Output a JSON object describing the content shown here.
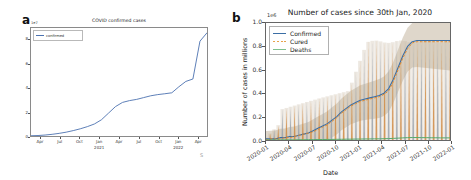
{
  "figure": {
    "panel_a_letter": "a",
    "panel_b_letter": "b",
    "footer_mark": "S"
  },
  "chart_data": [
    {
      "id": "panel_a",
      "type": "line",
      "title": "COVID confirmed cases",
      "xlabel": "",
      "ylabel": "",
      "y_offset_text": "1e7",
      "ylim": [
        0,
        9
      ],
      "yticks": [
        "0",
        "2",
        "4",
        "6",
        "8"
      ],
      "ytick_values": [
        0,
        2,
        4,
        6,
        8
      ],
      "xticks": [
        "Apr",
        "Jul",
        "Oct",
        "Jan",
        "Apr",
        "Jul",
        "Oct",
        "Jan",
        "Apr"
      ],
      "xtick_sublabels": [
        "",
        "",
        "",
        "2021",
        "",
        "",
        "",
        "2022",
        ""
      ],
      "grid": false,
      "legend_position": "upper left",
      "series": [
        {
          "name": "confirmed",
          "color": "#4c72b0",
          "x": [
            0,
            4,
            8,
            12,
            16,
            20,
            24,
            28,
            32,
            36,
            40,
            44,
            48,
            52,
            56,
            60,
            64,
            68,
            72,
            76,
            80,
            84,
            88,
            92,
            96,
            100
          ],
          "values": [
            0.02,
            0.04,
            0.08,
            0.14,
            0.22,
            0.32,
            0.45,
            0.6,
            0.78,
            1.0,
            1.35,
            1.9,
            2.45,
            2.8,
            2.95,
            3.05,
            3.2,
            3.35,
            3.45,
            3.52,
            3.6,
            4.1,
            4.55,
            4.75,
            7.9,
            8.6
          ]
        }
      ]
    },
    {
      "id": "panel_b",
      "type": "line",
      "title": "Number of cases since 30th Jan, 2020",
      "xlabel": "Date",
      "ylabel": "Number of cases in millions",
      "y_offset_text": "1e6",
      "ylim": [
        0.0,
        1.0
      ],
      "yticks": [
        "0.0",
        "0.2",
        "0.4",
        "0.6",
        "0.8",
        "1.0"
      ],
      "ytick_values": [
        0.0,
        0.2,
        0.4,
        0.6,
        0.8,
        1.0
      ],
      "xticks": [
        "2020-01",
        "2020-04",
        "2020-07",
        "2020-10",
        "2021-01",
        "2021-04",
        "2021-07",
        "2021-10",
        "2022-01"
      ],
      "grid": false,
      "legend_position": "upper left",
      "legend": [
        {
          "label": "Confirmed",
          "color": "#3b6ea5",
          "style": "solid"
        },
        {
          "label": "Cured",
          "color": "#e08a2e",
          "style": "dashed"
        },
        {
          "label": "Deaths",
          "color": "#56a96a",
          "style": "solid"
        }
      ],
      "series": [
        {
          "name": "Confirmed",
          "color": "#3b6ea5",
          "values": [
            0.01,
            0.01,
            0.01,
            0.02,
            0.02,
            0.03,
            0.03,
            0.04,
            0.05,
            0.06,
            0.08,
            0.1,
            0.12,
            0.14,
            0.17,
            0.2,
            0.24,
            0.27,
            0.3,
            0.32,
            0.34,
            0.35,
            0.36,
            0.37,
            0.38,
            0.4,
            0.44,
            0.52,
            0.62,
            0.72,
            0.8,
            0.84,
            0.85,
            0.85,
            0.85,
            0.85,
            0.85,
            0.85,
            0.85,
            0.85
          ]
        },
        {
          "name": "Cured",
          "color": "#e08a2e",
          "values": [
            0.0,
            0.01,
            0.01,
            0.01,
            0.02,
            0.02,
            0.03,
            0.04,
            0.05,
            0.06,
            0.07,
            0.09,
            0.11,
            0.13,
            0.16,
            0.19,
            0.23,
            0.26,
            0.29,
            0.31,
            0.33,
            0.34,
            0.35,
            0.36,
            0.37,
            0.39,
            0.42,
            0.5,
            0.6,
            0.7,
            0.78,
            0.83,
            0.84,
            0.84,
            0.84,
            0.84,
            0.84,
            0.84,
            0.84,
            0.84
          ]
        },
        {
          "name": "Deaths",
          "color": "#56a96a",
          "values": [
            0.0,
            0.0,
            0.0,
            0.0,
            0.001,
            0.001,
            0.001,
            0.002,
            0.002,
            0.003,
            0.003,
            0.004,
            0.004,
            0.005,
            0.005,
            0.006,
            0.006,
            0.007,
            0.007,
            0.008,
            0.008,
            0.009,
            0.009,
            0.01,
            0.01,
            0.011,
            0.012,
            0.014,
            0.016,
            0.018,
            0.02,
            0.021,
            0.021,
            0.02,
            0.02,
            0.019,
            0.019,
            0.018,
            0.018,
            0.018
          ]
        }
      ],
      "oscillation_note": "dense high-frequency spikes with shaded uncertainty band"
    }
  ]
}
